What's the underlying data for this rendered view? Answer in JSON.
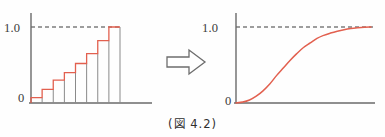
{
  "figure": {
    "caption": "(図 4.2)",
    "arrow_icon": "right-block-arrow-icon"
  },
  "colors": {
    "curve": "#e2604f",
    "axis": "#6a6a6a",
    "bar_outline": "#8a8a8a",
    "dashed_guide": "#3c3c3c",
    "text": "#3a3a3a",
    "background": "#fefefe"
  },
  "left_panel": {
    "name": "empirical-distribution-step-chart",
    "y_top_label": "1.0",
    "y_zero_label": "0"
  },
  "right_panel": {
    "name": "limiting-distribution-curve-chart",
    "y_top_label": "1.0",
    "y_zero_label": "0"
  },
  "chart_data": [
    {
      "type": "bar",
      "title": "",
      "subtitle": "",
      "xlabel": "",
      "ylabel": "",
      "categories": [
        "1",
        "2",
        "3",
        "4",
        "5",
        "6",
        "7",
        "8"
      ],
      "values": [
        0.07,
        0.18,
        0.3,
        0.4,
        0.52,
        0.65,
        0.82,
        1.0
      ],
      "step_outline": true,
      "ylim": [
        0,
        1.08
      ],
      "yticks": [
        0,
        1.0
      ],
      "ytick_labels": [
        "0",
        "1.0"
      ],
      "grid": false,
      "legend": null,
      "annotations": [
        {
          "text": "1.0",
          "type": "dashed-guide-line",
          "y": 1.0
        }
      ],
      "series": [
        {
          "name": "cumulative-step",
          "values": [
            0.07,
            0.18,
            0.3,
            0.4,
            0.52,
            0.65,
            0.82,
            1.0
          ]
        }
      ]
    },
    {
      "type": "line",
      "title": "",
      "subtitle": "",
      "xlabel": "",
      "ylabel": "",
      "x": [
        0.0,
        0.05,
        0.1,
        0.15,
        0.2,
        0.25,
        0.3,
        0.35,
        0.4,
        0.45,
        0.5,
        0.55,
        0.6,
        0.65,
        0.7,
        0.75,
        0.8,
        0.85,
        0.9,
        0.95,
        1.0
      ],
      "y": [
        0.0,
        0.012,
        0.04,
        0.09,
        0.16,
        0.25,
        0.36,
        0.46,
        0.56,
        0.65,
        0.73,
        0.79,
        0.85,
        0.89,
        0.92,
        0.945,
        0.965,
        0.98,
        0.99,
        0.997,
        1.0
      ],
      "ylim": [
        0,
        1.08
      ],
      "xlim": [
        0,
        1.15
      ],
      "yticks": [
        0,
        1.0
      ],
      "ytick_labels": [
        "0",
        "1.0"
      ],
      "grid": false,
      "legend": null,
      "annotations": [
        {
          "text": "1.0",
          "type": "dashed-guide-line",
          "y": 1.0
        }
      ],
      "series": [
        {
          "name": "limiting-cdf",
          "values": [
            0.0,
            0.012,
            0.04,
            0.09,
            0.16,
            0.25,
            0.36,
            0.46,
            0.56,
            0.65,
            0.73,
            0.79,
            0.85,
            0.89,
            0.92,
            0.945,
            0.965,
            0.98,
            0.99,
            0.997,
            1.0
          ]
        }
      ]
    }
  ]
}
